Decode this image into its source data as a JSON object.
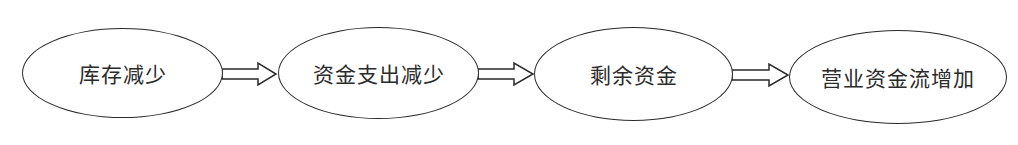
{
  "diagram": {
    "type": "flowchart",
    "direction": "left-to-right",
    "top_fragment": "",
    "nodes": [
      {
        "id": "n1",
        "label": "库存减少"
      },
      {
        "id": "n2",
        "label": "资金支出减少"
      },
      {
        "id": "n3",
        "label": "剩余资金"
      },
      {
        "id": "n4",
        "label": "营业资金流增加"
      }
    ],
    "edges": [
      {
        "from": "n1",
        "to": "n2",
        "style": "hollow-block-arrow"
      },
      {
        "from": "n2",
        "to": "n3",
        "style": "hollow-block-arrow"
      },
      {
        "from": "n3",
        "to": "n4",
        "style": "hollow-block-arrow"
      }
    ],
    "colors": {
      "stroke": "#2a2a2a",
      "text": "#2b2b2b",
      "background": "#ffffff"
    }
  }
}
